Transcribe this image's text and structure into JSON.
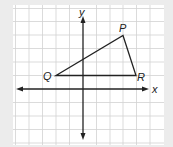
{
  "diagram": {
    "type": "coordinate-plane-triangle",
    "axes": {
      "x_label": "x",
      "y_label": "y"
    },
    "grid": {
      "columns": 11,
      "rows": 10,
      "color": "#cfcfcf"
    },
    "triangle": {
      "vertices": [
        {
          "label": "P",
          "grid": [
            3,
            4
          ]
        },
        {
          "label": "Q",
          "grid": [
            -2,
            1
          ]
        },
        {
          "label": "R",
          "grid": [
            4,
            1
          ]
        }
      ],
      "stroke": "#222222"
    },
    "background": "#ececec",
    "panel": "#ffffff"
  }
}
